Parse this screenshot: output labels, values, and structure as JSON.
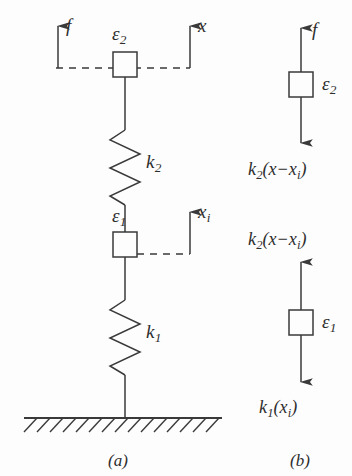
{
  "figure": {
    "title_panels": [
      "(a)",
      "(b)"
    ],
    "stroke_color": "#3a3a3a",
    "background_color": "#fdfdfd",
    "text_color": "#2e2e2e"
  },
  "panel_a": {
    "caption": "(a)",
    "force_label": "f",
    "displacement_top": {
      "symbol": "x",
      "subscript": ""
    },
    "displacement_mid": {
      "symbol": "x",
      "subscript": "i"
    },
    "element_top": {
      "symbol": "ε",
      "subscript": "2"
    },
    "element_mid": {
      "symbol": "ε",
      "subscript": "1"
    },
    "spring_upper": {
      "symbol": "k",
      "subscript": "2"
    },
    "spring_lower": {
      "symbol": "k",
      "subscript": "1"
    },
    "ground": "hatched-fixed-support"
  },
  "panel_b": {
    "caption": "(b)",
    "body_top": {
      "element": {
        "symbol": "ε",
        "subscript": "2"
      },
      "force_up": "f",
      "force_down_prefix": "k",
      "force_down_sub": "2",
      "force_down_expr": "(x−x",
      "force_down_expr_sub": "i",
      "force_down_expr_end": ")"
    },
    "body_bottom": {
      "element": {
        "symbol": "ε",
        "subscript": "1"
      },
      "force_up_prefix": "k",
      "force_up_sub": "2",
      "force_up_expr": "(x−x",
      "force_up_expr_sub": "i",
      "force_up_expr_end": ")",
      "force_down_prefix": "k",
      "force_down_sub": "1",
      "force_down_expr": "(x",
      "force_down_expr_sub": "i",
      "force_down_expr_end": ")"
    }
  }
}
